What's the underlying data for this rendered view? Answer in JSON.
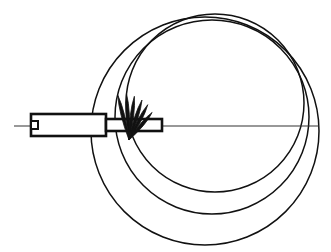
{
  "figure": {
    "type": "technical-line-drawing",
    "title": "",
    "canvas": {
      "width": 331,
      "height": 252,
      "background": "#ffffff"
    },
    "stroke_color": "#111111",
    "axis": {
      "label": "centerline-axis",
      "x1": 14,
      "y1": 126,
      "x2": 319,
      "y2": 126,
      "stroke_width": 1.1,
      "color": "#333333"
    },
    "rod": {
      "label": "probe-rod",
      "thick_section": {
        "x": 31,
        "y": 114,
        "width": 75,
        "height": 22
      },
      "thin_section": {
        "x": 106,
        "y": 119,
        "width": 56,
        "height": 12
      },
      "notch": {
        "x": 31,
        "y": 121,
        "width": 7,
        "height": 8
      },
      "stroke_width": 2.6,
      "fill": "#ffffff"
    },
    "spikes": {
      "label": "radiating-spikes",
      "origin_x": 129,
      "origin_y": 140,
      "count": 6,
      "angles_deg": [
        -104,
        -93,
        -83,
        -72,
        -62,
        -50
      ],
      "lengths": [
        46,
        46,
        44,
        42,
        40,
        36
      ],
      "half_width": 3.4,
      "fill": "#111111"
    },
    "circles": {
      "label": "wavefront-circles",
      "common_point_x": 129,
      "common_point_y": 140,
      "stroke_width": 1.5,
      "items": [
        {
          "name": "wavefront-outer",
          "cx": 205,
          "cy": 131,
          "r": 114
        },
        {
          "name": "wavefront-middle",
          "cx": 212,
          "cy": 117,
          "r": 97
        },
        {
          "name": "wavefront-inner",
          "cx": 215,
          "cy": 103,
          "r": 89
        }
      ]
    }
  },
  "chart_data": {
    "type": "scatter",
    "title": "",
    "xlabel": "",
    "ylabel": "",
    "annotations": [
      "centerline axis",
      "probe rod",
      "radiating spike fan",
      "three overlapping wavefront circles"
    ]
  }
}
